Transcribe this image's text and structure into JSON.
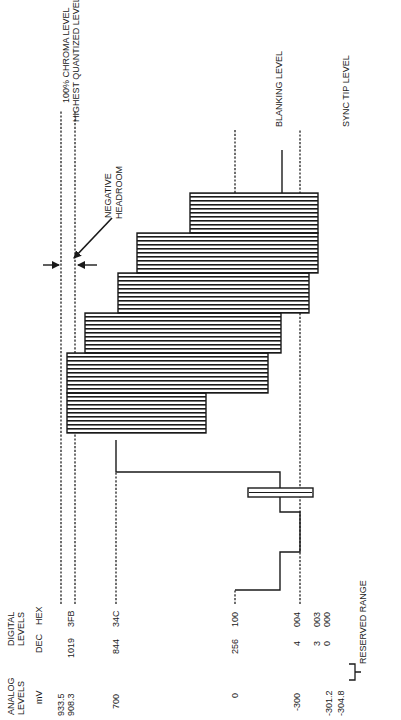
{
  "diagram": {
    "type": "video_waveform_levels",
    "orientation": "rotated_90_ccw",
    "headers": {
      "analog": [
        "ANALOG",
        "LEVELS"
      ],
      "analog_unit": "mV",
      "digital": [
        "DIGITAL",
        "LEVELS"
      ],
      "dec": "DEC",
      "hex": "HEX"
    },
    "levels": [
      {
        "mv": "933.5",
        "dec": "",
        "hex": "",
        "label": "100% CHROMA LEVEL"
      },
      {
        "mv": "908.3",
        "dec": "1019",
        "hex": "3FB",
        "label": "HIGHEST QUANTIZED LEVEL"
      },
      {
        "mv": "700",
        "dec": "844",
        "hex": "34C",
        "label": ""
      },
      {
        "mv": "0",
        "dec": "256",
        "hex": "100",
        "label": "BLANKING LEVEL"
      },
      {
        "mv": "-300",
        "dec": "4",
        "hex": "004",
        "label": "SYNC TIP LEVEL"
      },
      {
        "mv": "-301.2",
        "dec": "3",
        "hex": "003",
        "label": ""
      },
      {
        "mv": "-304.8",
        "dec": "0",
        "hex": "000",
        "label": ""
      }
    ],
    "annotations": {
      "negative_headroom": [
        "NEGATIVE",
        "HEADROOM"
      ],
      "reserved_range": "RESERVED RANGE"
    }
  }
}
